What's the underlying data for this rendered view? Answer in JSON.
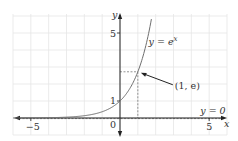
{
  "chart_data": {
    "type": "line",
    "title": "",
    "xlabel": "x",
    "ylabel": "y",
    "xlim": [
      -6,
      6
    ],
    "ylim": [
      -1,
      6
    ],
    "grid": true,
    "x_ticks": [
      {
        "value": -5,
        "label": "−5"
      },
      {
        "value": 5,
        "label": "5"
      }
    ],
    "y_ticks": [
      {
        "value": 1,
        "label": "1"
      },
      {
        "value": 5,
        "label": "5"
      }
    ],
    "origin_label": "0",
    "series": [
      {
        "name": "y = e^x",
        "function": "exp(x)",
        "label_base": "y = e",
        "label_sup": "x",
        "color": "#6e6e6e",
        "x_range": [
          -6,
          1.8
        ]
      }
    ],
    "asymptote": {
      "label": "y = 0",
      "y": 0
    },
    "annotations": [
      {
        "label": "(1, e)",
        "point": [
          1,
          2.718
        ]
      }
    ],
    "guides": {
      "point": [
        1,
        2.718
      ],
      "style": "dashed"
    }
  }
}
